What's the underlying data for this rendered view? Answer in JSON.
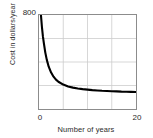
{
  "chart_data": {
    "type": "line",
    "title": "",
    "xlabel": "Number of years",
    "ylabel": "Cost in dollars/year",
    "xlim": [
      0,
      20
    ],
    "ylim": [
      0,
      800
    ],
    "xticks": [
      "0",
      "20"
    ],
    "yticks": [
      "800"
    ],
    "grid": true,
    "grid_x_divisions": 4,
    "grid_y_divisions": 4,
    "legend": "none",
    "series": [
      {
        "name": "Cost per year",
        "description": "Decaying hyperbolic curve approaching a horizontal asymptote near 140 dollars/year",
        "x": [
          0.4,
          0.6,
          0.8,
          1.0,
          1.3,
          1.6,
          2.0,
          2.5,
          3.0,
          3.5,
          4.0,
          5.0,
          6.0,
          7.0,
          8.0,
          9.0,
          10.0,
          11.0,
          12.0,
          13.0,
          14.0,
          15.0,
          16.0,
          17.0,
          18.0,
          19.0,
          20.0
        ],
        "y": [
          800,
          700,
          620,
          560,
          480,
          420,
          360,
          310,
          275,
          250,
          232,
          208,
          192,
          182,
          175,
          169,
          165,
          161,
          158,
          155,
          153,
          151,
          150,
          148,
          147,
          146,
          145
        ]
      }
    ],
    "curve_color": "#000000",
    "grid_color": "#cccccc",
    "frame_color": "#8c8c8c"
  }
}
